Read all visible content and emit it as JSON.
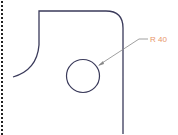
{
  "diagram": {
    "type": "technical-drawing",
    "annotation": {
      "label": "R 40",
      "color": "#e8956a"
    },
    "colors": {
      "outline": "#3a3a5a",
      "leader": "#888888",
      "border_dots": "#222222",
      "background": "#ffffff"
    }
  }
}
